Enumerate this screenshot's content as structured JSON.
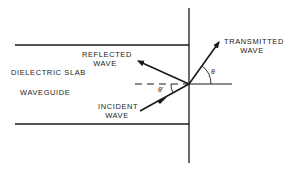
{
  "diagram": {
    "labels": {
      "slab": "DIELECTRIC SLAB",
      "waveguide": "WAVEGUIDE",
      "reflected_1": "REFLECTED",
      "reflected_2": "WAVE",
      "incident_1": "INCIDENT",
      "incident_2": "WAVE",
      "transmitted_1": "TRANSMITTED",
      "transmitted_2": "WAVE",
      "theta": "θ",
      "theta_prime": "θ'"
    },
    "colors": {
      "line": "#1a1a1a",
      "background": "#ffffff"
    }
  }
}
